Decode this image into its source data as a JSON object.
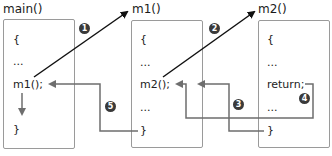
{
  "functions": [
    {
      "name": "main()",
      "lines": [
        "{",
        "...",
        "m1();",
        "}"
      ]
    },
    {
      "name": "m1()",
      "lines": [
        "{",
        "...",
        "m2();",
        "...",
        "}"
      ]
    },
    {
      "name": "m2()",
      "lines": [
        "{",
        "...",
        "return;",
        "...",
        "}"
      ]
    }
  ],
  "steps": [
    "1",
    "2",
    "3",
    "4",
    "5"
  ],
  "colors": {
    "call_arrow": "#111111",
    "return_arrow": "#6e6e6e",
    "box_border": "#9a9a9a",
    "badge": "#3a3a3a"
  }
}
